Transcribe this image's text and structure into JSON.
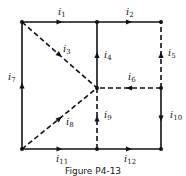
{
  "figure": {
    "caption": "Figure P4-13",
    "nodes": [
      {
        "id": "A",
        "x": 22,
        "y": 22
      },
      {
        "id": "B",
        "x": 97,
        "y": 22
      },
      {
        "id": "C",
        "x": 161,
        "y": 22
      },
      {
        "id": "D",
        "x": 97,
        "y": 88
      },
      {
        "id": "E",
        "x": 161,
        "y": 88
      },
      {
        "id": "F",
        "x": 22,
        "y": 149
      },
      {
        "id": "G",
        "x": 97,
        "y": 149
      },
      {
        "id": "H",
        "x": 161,
        "y": 149
      }
    ],
    "branches": [
      {
        "name": "i1",
        "base": "i",
        "sub": "1",
        "from": "A",
        "to": "B",
        "style": "solid",
        "label_x": 58,
        "label_y": 15
      },
      {
        "name": "i2",
        "base": "i",
        "sub": "2",
        "from": "B",
        "to": "C",
        "style": "solid",
        "label_x": 126,
        "label_y": 15
      },
      {
        "name": "i3",
        "base": "i",
        "sub": "3",
        "from": "A",
        "to": "D",
        "style": "dashed",
        "label_x": 63,
        "label_y": 52
      },
      {
        "name": "i4",
        "base": "i",
        "sub": "4",
        "from": "D",
        "to": "B",
        "style": "solid",
        "label_x": 104,
        "label_y": 58
      },
      {
        "name": "i5",
        "base": "i",
        "sub": "5",
        "from": "E",
        "to": "C",
        "style": "dashed",
        "label_x": 168,
        "label_y": 56
      },
      {
        "name": "i6",
        "base": "i",
        "sub": "6",
        "from": "E",
        "to": "D",
        "style": "dashed",
        "label_x": 128,
        "label_y": 80
      },
      {
        "name": "i7",
        "base": "i",
        "sub": "7",
        "from": "F",
        "to": "A",
        "style": "solid",
        "label_x": 8,
        "label_y": 80
      },
      {
        "name": "i8",
        "base": "i",
        "sub": "8",
        "from": "F",
        "to": "D",
        "style": "dashed",
        "label_x": 66,
        "label_y": 125
      },
      {
        "name": "i9",
        "base": "i",
        "sub": "9",
        "from": "G",
        "to": "D",
        "style": "dashed",
        "label_x": 104,
        "label_y": 118
      },
      {
        "name": "i10",
        "base": "i",
        "sub": "10",
        "from": "E",
        "to": "H",
        "style": "solid",
        "label_x": 170,
        "label_y": 118
      },
      {
        "name": "i11",
        "base": "i",
        "sub": "11",
        "from": "F",
        "to": "G",
        "style": "solid",
        "label_x": 56,
        "label_y": 162
      },
      {
        "name": "i12",
        "base": "i",
        "sub": "12",
        "from": "G",
        "to": "H",
        "style": "solid",
        "label_x": 124,
        "label_y": 162
      }
    ]
  }
}
